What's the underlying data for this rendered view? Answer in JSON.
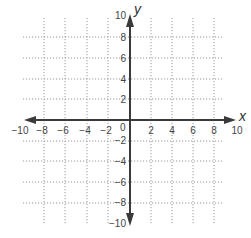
{
  "diagram": {
    "type": "coordinate-plane",
    "x_axis": {
      "label": "x",
      "min": -10,
      "max": 10,
      "tick_step": 2,
      "tick_labels": [
        "−10",
        "−8",
        "−6",
        "−4",
        "−2",
        "2",
        "4",
        "6",
        "8",
        "10"
      ]
    },
    "y_axis": {
      "label": "y",
      "min": -10,
      "max": 10,
      "tick_step": 2,
      "tick_labels_positive": [
        "10",
        "8",
        "6",
        "4",
        "2"
      ],
      "tick_labels_negative": [
        "−2",
        "−4",
        "−6",
        "−8",
        "−10"
      ]
    },
    "origin_label": "0",
    "grid": "dotted",
    "colors": {
      "axis": "#3a3a3a",
      "grid": "#9a9a9a",
      "text": "#444444"
    }
  }
}
